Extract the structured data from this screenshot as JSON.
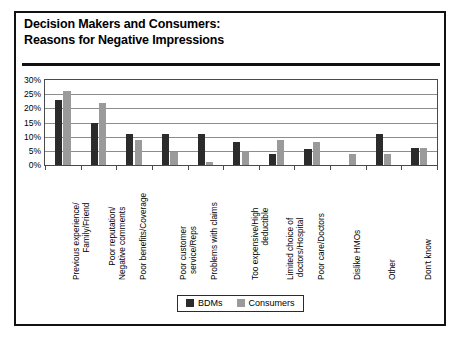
{
  "chart_data": {
    "type": "bar",
    "title": "Decision Makers and Consumers: Reasons for Negative Impressions",
    "title_lines": [
      "Decision Makers and Consumers:",
      "Reasons for Negative Impressions"
    ],
    "xlabel": "",
    "ylabel": "",
    "ylim": [
      0,
      30
    ],
    "ytick_labels": [
      "30%",
      "25%",
      "20%",
      "15%",
      "10%",
      "5%",
      "0%"
    ],
    "ytick_values": [
      30,
      25,
      20,
      15,
      10,
      5,
      0
    ],
    "grid": true,
    "legend_position": "bottom-center",
    "categories": [
      "Previous experience/ Family/Friend",
      "Poor reputation/ Negative comments",
      "Poor benefits/Coverage",
      "Poor customer service/Reps",
      "Problems with claims",
      "Too expensive/High deductible",
      "Limited choice of doctors/Hospital",
      "Poor care/Doctors",
      "Dislike HMOs",
      "Other",
      "Don't know"
    ],
    "category_lines": [
      [
        "Previous experience/",
        "Family/Friend"
      ],
      [
        "Poor reputation/",
        "Negative comments"
      ],
      [
        "Poor benefits/Coverage",
        ""
      ],
      [
        "Poor customer",
        "service/Reps"
      ],
      [
        "Problems with claims",
        ""
      ],
      [
        "Too expensive/High",
        "deductible"
      ],
      [
        "Limited choice of",
        "doctors/Hospital"
      ],
      [
        "Poor care/Doctors",
        ""
      ],
      [
        "Dislike HMOs",
        ""
      ],
      [
        "Other",
        ""
      ],
      [
        "Don't know",
        ""
      ]
    ],
    "series": [
      {
        "name": "BDMs",
        "color": "#2b2b2b",
        "values": [
          23,
          15,
          11,
          11,
          11,
          8,
          4,
          5.5,
          0,
          11,
          6
        ]
      },
      {
        "name": "Consumers",
        "color": "#9a9a9a",
        "values": [
          26,
          22,
          9,
          4.5,
          1,
          5,
          9,
          8,
          4,
          4,
          6
        ]
      }
    ]
  },
  "legend": {
    "items": [
      {
        "label": "BDMs",
        "swatch": "dark-square-swatch"
      },
      {
        "label": "Consumers",
        "swatch": "gray-square-swatch"
      }
    ]
  }
}
